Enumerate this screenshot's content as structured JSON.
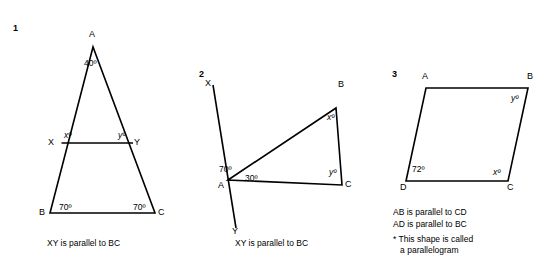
{
  "page": {
    "width": 552,
    "height": 272,
    "background": "#ffffff",
    "stroke_color": "#000000"
  },
  "questions": [
    {
      "number": "1",
      "vertices": [
        {
          "name": "A",
          "label": "A"
        },
        {
          "name": "B",
          "label": "B"
        },
        {
          "name": "C",
          "label": "C"
        },
        {
          "name": "X",
          "label": "X"
        },
        {
          "name": "Y",
          "label": "Y"
        }
      ],
      "angles": [
        {
          "at": "A",
          "label": "40º"
        },
        {
          "at": "X",
          "label": "xº"
        },
        {
          "at": "Y",
          "label": "yº"
        },
        {
          "at": "B",
          "label": "70º"
        },
        {
          "at": "C",
          "label": "70º"
        }
      ],
      "caption": "XY is parallel to BC"
    },
    {
      "number": "2",
      "vertices": [
        {
          "name": "X",
          "label": "X"
        },
        {
          "name": "Y",
          "label": "Y"
        },
        {
          "name": "A",
          "label": "A"
        },
        {
          "name": "B",
          "label": "B"
        },
        {
          "name": "C",
          "label": "C"
        }
      ],
      "angles": [
        {
          "at": "A-upper",
          "label": "70º"
        },
        {
          "at": "A-right",
          "label": "30º"
        },
        {
          "at": "B",
          "label": "xº"
        },
        {
          "at": "C",
          "label": "yº"
        }
      ],
      "caption": "XY is parallel to BC"
    },
    {
      "number": "3",
      "vertices": [
        {
          "name": "A",
          "label": "A"
        },
        {
          "name": "B",
          "label": "B"
        },
        {
          "name": "C",
          "label": "C"
        },
        {
          "name": "D",
          "label": "D"
        }
      ],
      "angles": [
        {
          "at": "B",
          "label": "yº"
        },
        {
          "at": "C",
          "label": "xº"
        },
        {
          "at": "D",
          "label": "72º"
        }
      ],
      "notes": [
        "AB is parallel to CD",
        "AD is parallel to BC"
      ],
      "footnote": "* This shape is called\n   a parallelogram"
    }
  ]
}
